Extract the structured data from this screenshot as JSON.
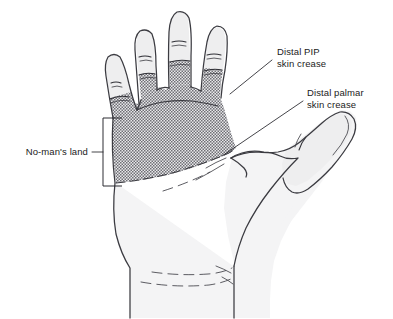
{
  "figure": {
    "background_color": "#ffffff",
    "outline_color": "#3b3b41",
    "skin_fill_color": "#f4f4f5",
    "zone_shading_color": "#8e8e92",
    "zone_shading_style": "stipple-halftone"
  },
  "annotations": [
    {
      "id": "distal-pip",
      "line1": "Distal PIP",
      "line2": "skin crease",
      "text_x": 277,
      "text_y": 55,
      "leader_from_x": 272,
      "leader_from_y": 60,
      "leader_to_x": 230,
      "leader_to_y": 94
    },
    {
      "id": "distal-palmar",
      "line1": "Distal palmar",
      "line2": "skin crease",
      "text_x": 307,
      "text_y": 96,
      "leader_from_x": 303,
      "leader_from_y": 101,
      "leader_to_x": 222,
      "leader_to_y": 156
    }
  ],
  "bracket_label": {
    "id": "no-mans-land",
    "text": "No-man's land",
    "text_x": 88,
    "text_y": 155,
    "stem_from_x": 92,
    "stem_from_y": 152,
    "stem_to_x": 103,
    "stem_to_y": 152,
    "bracket_x": 103,
    "bracket_top_y": 118,
    "bracket_bottom_y": 186,
    "bracket_arm_x": 122
  },
  "anatomy": {
    "digits": [
      {
        "name": "little-finger",
        "dip_crease": true,
        "pip_crease": true
      },
      {
        "name": "ring-finger",
        "dip_crease": true,
        "pip_crease": true
      },
      {
        "name": "middle-finger",
        "dip_crease": true,
        "pip_crease": true
      },
      {
        "name": "index-finger",
        "dip_crease": true,
        "pip_crease": true
      },
      {
        "name": "thumb",
        "ip_crease": true,
        "pip_crease": false
      }
    ],
    "zone_label": "No-man's land",
    "zone_proximal_border": "Distal palmar skin crease",
    "zone_distal_border": "Distal PIP skin crease"
  }
}
